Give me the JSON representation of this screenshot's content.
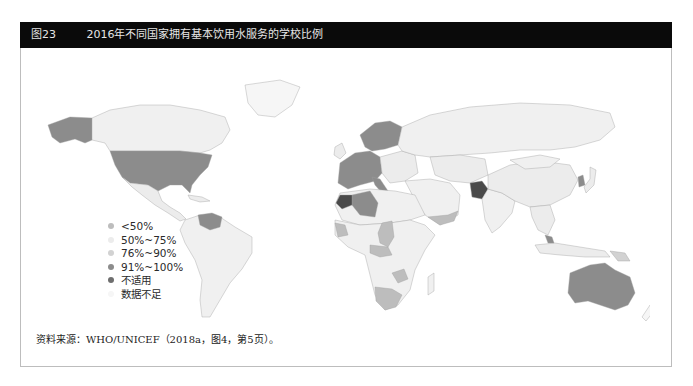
{
  "header": {
    "figure_number": "图23",
    "title": "2016年不同国家拥有基本饮用水服务的学校比例"
  },
  "legend": {
    "items": [
      {
        "label": "<50%",
        "color": "#bdbdbd"
      },
      {
        "label": "50%~75%",
        "color": "#ececec"
      },
      {
        "label": "76%~90%",
        "color": "#d2d2d2"
      },
      {
        "label": "91%~100%",
        "color": "#8c8c8c"
      },
      {
        "label": "不适用",
        "color": "#6e6e6e"
      },
      {
        "label": "数据不足",
        "color": "#f6f6f6"
      }
    ]
  },
  "map": {
    "colors": {
      "lt50": "#bdbdbd",
      "r50_75": "#ececec",
      "r76_90": "#d2d2d2",
      "r91_100": "#8c8c8c",
      "na": "#4a4a4a",
      "insufficient": "#f6f6f6",
      "border": "#9a9a9a"
    }
  },
  "source": {
    "text": "资料来源：WHO/UNICEF（2018a，图4，第5页）。"
  }
}
